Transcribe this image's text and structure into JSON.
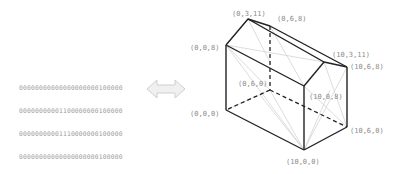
{
  "binary_grid": {
    "rows": [
      "00000000000000000000100000",
      "00000000001100000000100000",
      "00000000001110000000100000",
      "00000000000000000000100000",
      "00000000000000000000100000",
      "00000000000000000000100000",
      "00000000000000000000100000",
      "00011110000001000110000000",
      "10000000000000000000100000"
    ]
  },
  "arrow": {
    "icon": "double-arrow-icon",
    "color": "#d9d9d9"
  },
  "house": {
    "vertex_labels": {
      "roof_top_front": "(0,3,11)",
      "roof_top_back": "(0,6,8)",
      "left_front_top": "(0,0,8)",
      "hidden_back_left": "(0,6,0)",
      "left_front_bottom": "(0,0,0)",
      "right_roof_top": "(10,3,11)",
      "right_back_top": "(10,6,8)",
      "right_front_top": "(10,0,8)",
      "right_back_bottom": "(10,6,0)",
      "right_front_bottom": "(10,0,0)"
    },
    "edge_color": "#222222",
    "mesh_color": "#cfcfcf",
    "label_color": "#8a8a8a"
  }
}
